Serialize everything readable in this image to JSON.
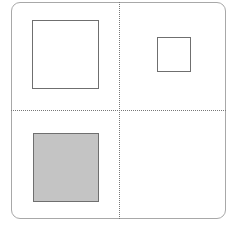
{
  "diagram": {
    "type": "quadrant-grid",
    "frame": {
      "border_color": "#a8a8a8",
      "corner": "rounded"
    },
    "dividers": {
      "style": "dotted",
      "color": "#777777"
    },
    "quadrants": [
      {
        "position": "top-left",
        "shape": "square",
        "size": "large",
        "fill": "#ffffff"
      },
      {
        "position": "top-right",
        "shape": "square",
        "size": "small",
        "fill": "#ffffff"
      },
      {
        "position": "bottom-left",
        "shape": "square",
        "size": "large",
        "fill": "#c4c4c4"
      },
      {
        "position": "bottom-right",
        "shape": "none"
      }
    ]
  }
}
